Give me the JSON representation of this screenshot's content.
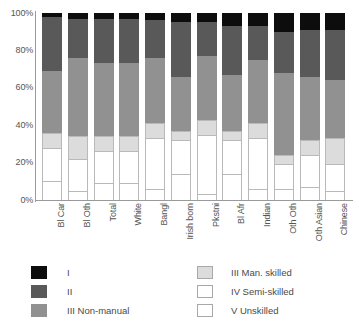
{
  "chart_data": {
    "type": "bar",
    "stacked": true,
    "stack_mode": "percent",
    "title": "",
    "subtitle": "",
    "xlabel": "",
    "ylabel": "",
    "ylim": [
      0,
      100
    ],
    "y_ticks": [
      0,
      20,
      40,
      60,
      80,
      100
    ],
    "y_tick_labels": [
      "0%",
      "20%",
      "40%",
      "60%",
      "80%",
      "100%"
    ],
    "grid": false,
    "legend_position": "bottom",
    "categories": [
      "Bl Car",
      "Bl Oth",
      "Total",
      "White",
      "Bangl",
      "Irish born",
      "Pkstni",
      "Bl Afr",
      "Indian",
      "Oth Oth",
      "Oth Asian",
      "Chinese"
    ],
    "series": [
      {
        "name": "I",
        "color": "#0d0d0d",
        "values": [
          2,
          3,
          3,
          3,
          4,
          5,
          5,
          7,
          7,
          10,
          9,
          9
        ]
      },
      {
        "name": "II",
        "color": "#595959",
        "values": [
          29,
          21,
          24,
          24,
          20,
          29,
          18,
          26,
          18,
          22,
          25,
          27
        ]
      },
      {
        "name": "III Non-manual",
        "color": "#919191",
        "values": [
          33,
          42,
          39,
          39,
          35,
          29,
          34,
          30,
          34,
          44,
          34,
          31
        ]
      },
      {
        "name": "III Man. skilled",
        "color": "#dcdcdc",
        "values": [
          8,
          12,
          8,
          8,
          8,
          5,
          8,
          5,
          8,
          5,
          8,
          14
        ]
      },
      {
        "name": "IV Semi-skilled",
        "color": "#ffffff",
        "values": [
          18,
          17,
          17,
          17,
          27,
          18,
          32,
          18,
          27,
          13,
          17,
          14
        ]
      },
      {
        "name": "V Unskilled",
        "color": "#ffffff",
        "values": [
          10,
          5,
          9,
          9,
          6,
          14,
          3,
          14,
          6,
          6,
          7,
          5
        ]
      }
    ],
    "cumulative_tops": [
      [
        10,
        28,
        36,
        69,
        98,
        100
      ],
      [
        5,
        22,
        34,
        76,
        97,
        100
      ],
      [
        9,
        26,
        34,
        73,
        97,
        100
      ],
      [
        9,
        26,
        34,
        73,
        97,
        100
      ],
      [
        6,
        33,
        41,
        76,
        96,
        100
      ],
      [
        14,
        32,
        37,
        66,
        95,
        100
      ],
      [
        3,
        35,
        43,
        77,
        95,
        100
      ],
      [
        14,
        32,
        37,
        67,
        93,
        100
      ],
      [
        6,
        33,
        41,
        75,
        93,
        100
      ],
      [
        6,
        19,
        24,
        68,
        90,
        100
      ],
      [
        7,
        24,
        32,
        66,
        91,
        100
      ],
      [
        5,
        19,
        33,
        64,
        91,
        100
      ]
    ]
  },
  "legend": {
    "left_column": [
      {
        "label": "I",
        "swatch": "cls-I"
      },
      {
        "label": "II",
        "swatch": "cls-II"
      },
      {
        "label": "III Non-manual",
        "swatch": "cls-IIIn"
      }
    ],
    "right_column": [
      {
        "label": "III Man. skilled",
        "swatch": "cls-IIIm"
      },
      {
        "label": "IV Semi-skilled",
        "swatch": "cls-IV"
      },
      {
        "label": "V Unskilled",
        "swatch": "cls-V"
      }
    ]
  },
  "colors": {
    "class_I": "#0d0d0d",
    "class_II": "#595959",
    "class_III_non_manual": "#919191",
    "class_III_man_skilled": "#dcdcdc",
    "class_IV_semi_skilled": "#ffffff",
    "class_V_unskilled": "#ffffff",
    "axis": "#9a9a9a",
    "text": "#4a4a4a",
    "background": "#ffffff"
  }
}
